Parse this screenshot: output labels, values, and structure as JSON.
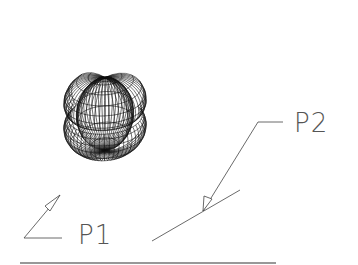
{
  "figure": {
    "type": "wireframe-drawing",
    "labels": [
      {
        "id": "p1",
        "text": "P1"
      },
      {
        "id": "p2",
        "text": "P2"
      }
    ],
    "colors": {
      "mesh": "#111111",
      "leader": "#444444",
      "label": "#555555",
      "baseline": "#333333",
      "background": "#ffffff"
    }
  }
}
